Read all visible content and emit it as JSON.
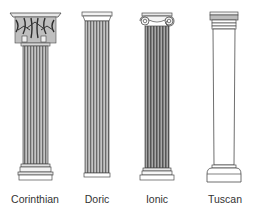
{
  "colors": {
    "background": "#ffffff",
    "line": "#4a4a4a",
    "fluting_dark": "#6e6e6e",
    "fluting_light": "#bdbdbd",
    "label": "#333333"
  },
  "columns": [
    {
      "name": "Corinthian",
      "center_x": 35,
      "style": "fluted, acanthus-leaf capital, molded base"
    },
    {
      "name": "Doric",
      "center_x": 97,
      "style": "fluted, plain square abacus, no base"
    },
    {
      "name": "Ionic",
      "center_x": 156,
      "style": "fluted, scroll volute capital, molded base"
    },
    {
      "name": "Tuscan",
      "center_x": 225,
      "style": "plain unfluted shaft, simple capital and base"
    }
  ]
}
